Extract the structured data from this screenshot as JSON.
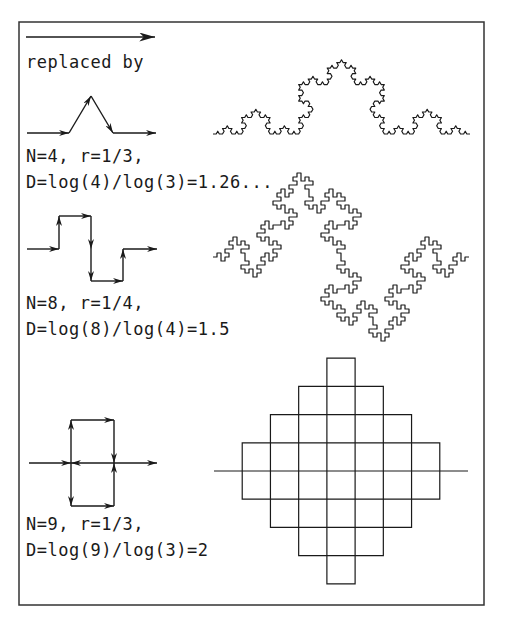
{
  "figure": {
    "frame": {
      "x": 19,
      "y": 22,
      "width": 465,
      "height": 583,
      "stroke": "#333333"
    },
    "ink_color": "#1a1a1a",
    "initiator": {
      "arrow": {
        "x1": 26,
        "y1": 37,
        "x2": 155,
        "y2": 37
      },
      "caption": "replaced by"
    },
    "rows": [
      {
        "name": "koch-curve",
        "generator_points": [
          [
            27,
            133
          ],
          [
            69,
            133
          ],
          [
            91,
            96
          ],
          [
            113,
            133
          ],
          [
            156,
            133
          ]
        ],
        "generator_arrows": [
          [
            0,
            1
          ],
          [
            1,
            2
          ],
          [
            2,
            3
          ],
          [
            3,
            4
          ]
        ],
        "line1": "N=4, r=1/3,",
        "line2": "D=log(4)/log(3)=1.26...",
        "fractal": {
          "type": "koch",
          "start": [
            213,
            134
          ],
          "end": [
            470,
            134
          ],
          "levels": 4
        }
      },
      {
        "name": "quadratic-koch-curve",
        "generator_points": [
          [
            27,
            249
          ],
          [
            59,
            249
          ],
          [
            59,
            216
          ],
          [
            91,
            216
          ],
          [
            91,
            249
          ],
          [
            91,
            281
          ],
          [
            123,
            281
          ],
          [
            123,
            249
          ],
          [
            157,
            249
          ]
        ],
        "generator_arrows": [
          [
            0,
            1
          ],
          [
            1,
            2
          ],
          [
            2,
            3
          ],
          [
            3,
            4
          ],
          [
            4,
            5
          ],
          [
            5,
            6
          ],
          [
            6,
            7
          ],
          [
            7,
            8
          ]
        ],
        "line1": "N=8, r=1/4,",
        "line2": "D=log(8)/log(4)=1.5",
        "fractal": {
          "type": "quadkoch",
          "start": [
            213,
            257
          ],
          "end": [
            469,
            257
          ],
          "levels": 3
        }
      },
      {
        "name": "peano-curve",
        "generator_points": [
          [
            29,
            463
          ],
          [
            71,
            463
          ],
          [
            71,
            420
          ],
          [
            114,
            420
          ],
          [
            114,
            463
          ],
          [
            71,
            463
          ],
          [
            71,
            506
          ],
          [
            114,
            506
          ],
          [
            114,
            463
          ],
          [
            157,
            463
          ]
        ],
        "generator_arrows": [
          [
            0,
            1
          ],
          [
            1,
            2
          ],
          [
            2,
            3
          ],
          [
            3,
            4
          ],
          [
            4,
            5
          ],
          [
            5,
            6
          ],
          [
            6,
            7
          ],
          [
            7,
            8
          ],
          [
            8,
            9
          ]
        ],
        "line1": "N=9, r=1/3,",
        "line2": "D=log(9)/log(3)=2",
        "fractal": {
          "type": "peano",
          "start": [
            214,
            471
          ],
          "end": [
            468,
            471
          ],
          "levels": 2
        }
      }
    ]
  }
}
